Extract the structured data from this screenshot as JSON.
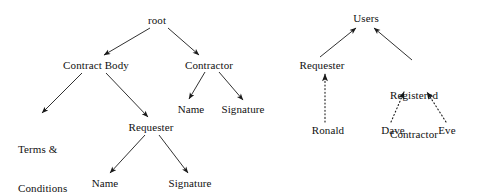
{
  "figure": {
    "background_color": "#ffffff",
    "edge_color": "#1a1a1a",
    "text_color": "#111111"
  },
  "diagrams": [
    {
      "id": "contract-tree",
      "title": "",
      "nodes": [
        {
          "id": "root",
          "label": "root",
          "x": 157,
          "y": 20
        },
        {
          "id": "contract-body",
          "label": "Contract Body",
          "x": 96,
          "y": 65
        },
        {
          "id": "contractor",
          "label": "Contractor",
          "x": 209,
          "y": 65
        },
        {
          "id": "terms-conditions",
          "label": "Terms &\nConditions",
          "x": 44,
          "y": 129
        },
        {
          "id": "requester",
          "label": "Requester",
          "x": 151,
          "y": 127
        },
        {
          "id": "contractor-name",
          "label": "Name",
          "x": 191,
          "y": 109
        },
        {
          "id": "contractor-signature",
          "label": "Signature",
          "x": 243,
          "y": 109
        },
        {
          "id": "requester-name",
          "label": "Name",
          "x": 105,
          "y": 183
        },
        {
          "id": "requester-signature",
          "label": "Signature",
          "x": 190,
          "y": 183
        }
      ],
      "edges": [
        {
          "from": "root",
          "to": "contract-body",
          "style": "solid",
          "direction": "down"
        },
        {
          "from": "root",
          "to": "contractor",
          "style": "solid",
          "direction": "down"
        },
        {
          "from": "contract-body",
          "to": "terms-conditions",
          "style": "solid",
          "direction": "down"
        },
        {
          "from": "contract-body",
          "to": "requester",
          "style": "solid",
          "direction": "down"
        },
        {
          "from": "contractor",
          "to": "contractor-name",
          "style": "solid",
          "direction": "down"
        },
        {
          "from": "contractor",
          "to": "contractor-signature",
          "style": "solid",
          "direction": "down"
        },
        {
          "from": "requester",
          "to": "requester-name",
          "style": "solid",
          "direction": "down"
        },
        {
          "from": "requester",
          "to": "requester-signature",
          "style": "solid",
          "direction": "down"
        }
      ]
    },
    {
      "id": "users-tree",
      "title": "",
      "nodes": [
        {
          "id": "users",
          "label": "Users",
          "x": 366,
          "y": 18
        },
        {
          "id": "u-requester",
          "label": "Requester",
          "x": 322,
          "y": 65
        },
        {
          "id": "registered-contractor",
          "label": "Registered\nContractor",
          "x": 414,
          "y": 76
        },
        {
          "id": "ronald",
          "label": "Ronald",
          "x": 328,
          "y": 130
        },
        {
          "id": "dave",
          "label": "Dave",
          "x": 393,
          "y": 130
        },
        {
          "id": "eve",
          "label": "Eve",
          "x": 447,
          "y": 130
        }
      ],
      "edges": [
        {
          "from": "u-requester",
          "to": "users",
          "style": "solid",
          "direction": "up"
        },
        {
          "from": "registered-contractor",
          "to": "users",
          "style": "solid",
          "direction": "up"
        },
        {
          "from": "ronald",
          "to": "u-requester",
          "style": "dotted",
          "direction": "up"
        },
        {
          "from": "dave",
          "to": "registered-contractor",
          "style": "dotted",
          "direction": "up"
        },
        {
          "from": "eve",
          "to": "registered-contractor",
          "style": "dotted",
          "direction": "up"
        }
      ]
    }
  ],
  "labels": {
    "root": "root",
    "contract_body": "Contract Body",
    "contractor": "Contractor",
    "terms_line1": "Terms &",
    "terms_line2": "Conditions",
    "requester": "Requester",
    "contractor_name": "Name",
    "contractor_signature": "Signature",
    "requester_name": "Name",
    "requester_signature": "Signature",
    "users": "Users",
    "users_requester": "Requester",
    "registered_line1": "Registered",
    "registered_line2": "Contractor",
    "ronald": "Ronald",
    "dave": "Dave",
    "eve": "Eve"
  }
}
